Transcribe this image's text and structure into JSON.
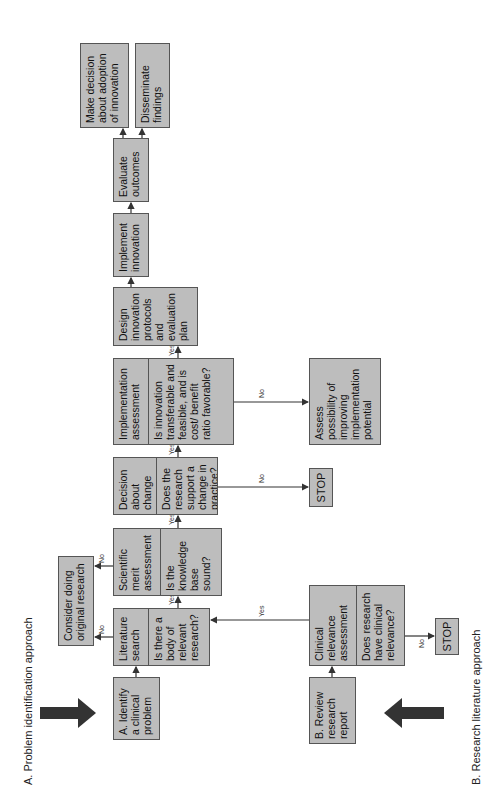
{
  "labels": {
    "approach_a": "A. Problem identification approach",
    "approach_b": "B. Research literature approach"
  },
  "boxes": {
    "identify_problem": "A. Identify a clinical problem",
    "literature_search": {
      "title": "Literature search",
      "question": "Is there a body of relevant research?"
    },
    "scientific_merit": {
      "title": "Scientific merit assessment",
      "question": "Is the knowledge base sound?"
    },
    "decision_change": {
      "title": "Decision about change",
      "question": "Does the research support a change in practice?"
    },
    "implementation_assessment": {
      "title": "Implementation assessment",
      "question": "Is innovation transferable and feasible, and is cost/ benefit ratio favorable?"
    },
    "design_protocols": "Design innovation protocols and evaluation plan",
    "implement_innovation": "Implement innovation",
    "evaluate_outcomes": "Evaluate outcomes",
    "make_decision": "Make decision about adoption of innovation",
    "disseminate": "Disseminate findings",
    "consider_original": "Consider doing original research",
    "stop_decision": "STOP",
    "assess_possibility": "Assess possibility of improving implementation potential",
    "review_report": "B. Review research report",
    "clinical_relevance": {
      "title": "Clinical relevance assessment",
      "question": "Does research have clinical relevance?"
    },
    "stop_clinical": "STOP"
  },
  "edge_labels": {
    "yes": "Yes",
    "no": "No"
  },
  "colors": {
    "box_fill": "#bdbdbd",
    "box_border": "#555555",
    "arrow": "#333333"
  }
}
